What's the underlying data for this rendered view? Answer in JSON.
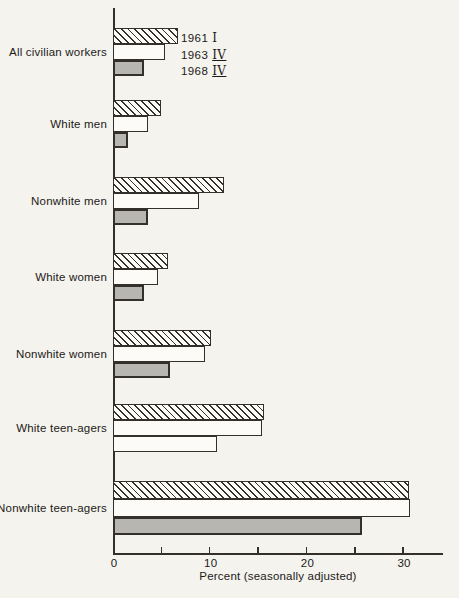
{
  "chart_data": {
    "type": "bar",
    "orientation": "horizontal",
    "title": "",
    "xlabel": "Percent (seasonally adjusted)",
    "ylabel": "",
    "xlim": [
      0,
      34
    ],
    "xticks_labeled": [
      0,
      10,
      20,
      30
    ],
    "xticks_minor": [
      5,
      15,
      25
    ],
    "grid": false,
    "legend_position": "inside-top-left-next-to-first-group",
    "categories": [
      "All civilian workers",
      "White men",
      "Nonwhite men",
      "White women",
      "Nonwhite women",
      "White teen-agers",
      "Nonwhite teen-agers"
    ],
    "series": [
      {
        "name": "1961 I",
        "style": "hatched",
        "values": [
          6.7,
          5.0,
          11.5,
          5.7,
          10.1,
          15.6,
          30.6
        ]
      },
      {
        "name": "1963 IV",
        "style": "white",
        "values": [
          5.4,
          3.6,
          8.9,
          4.7,
          9.5,
          15.4,
          30.7
        ]
      },
      {
        "name": "1968 IV",
        "style": "gray",
        "values": [
          3.2,
          1.6,
          3.6,
          3.2,
          5.9,
          10.8,
          25.7
        ]
      }
    ],
    "style_overrides": [
      {
        "category_index": 5,
        "series_index": 2,
        "style": "white"
      }
    ],
    "legend": {
      "items": [
        {
          "label": "1961 I",
          "year": "1961",
          "quarter": "I",
          "quarter_underlined": false
        },
        {
          "label": "1963 IV",
          "year": "1963",
          "quarter": "IV",
          "quarter_underlined": true
        },
        {
          "label": "1968 IV",
          "year": "1968",
          "quarter": "IV",
          "quarter_underlined": true
        }
      ]
    },
    "colors": {
      "background": "#f5f3ee",
      "bar_white_fill": "#fcfbf8",
      "bar_gray_fill": "#b8b6b1",
      "bar_border": "#33302b",
      "hatch_line": "#33302b",
      "axis_line": "#33302b",
      "text": "#1b1a18"
    }
  }
}
